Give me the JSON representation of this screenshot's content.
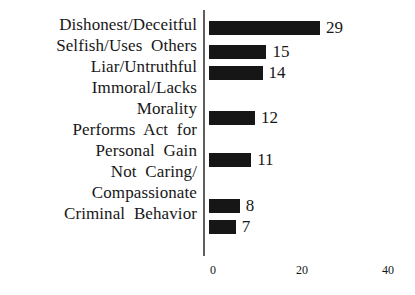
{
  "chart_data": {
    "type": "bar",
    "orientation": "horizontal",
    "title": "",
    "subtitle": "",
    "xlabel": "",
    "ylabel": "",
    "categories": [
      "Dishonest/Deceitful",
      "Selfish/Uses  Others",
      "Liar/Untruthful",
      "Immoral/Lacks\nMorality",
      "Performs  Act  for\nPersonal  Gain",
      "Not  Caring/\nCompassionate",
      "Criminal  Behavior"
    ],
    "values": [
      29,
      15,
      14,
      12,
      11,
      8,
      7
    ],
    "value_labels": [
      "29",
      "15",
      "14",
      "12",
      "11",
      "8",
      "7"
    ],
    "xlim": [
      0,
      40
    ],
    "xticks": [
      0,
      20,
      40
    ],
    "xtick_labels": [
      "0",
      "20",
      "40"
    ],
    "grid": false,
    "legend": null,
    "bar_color": "#161616",
    "axis_color": "#5f5f5f",
    "text_color": "#171717",
    "background_color": "#ffffff"
  },
  "labels": {
    "lines": [
      "Dishonest/Deceitful",
      "Selfish/Uses  Others",
      "Liar/Untruthful",
      "Immoral/Lacks",
      "Morality",
      "Performs  Act  for",
      "Personal  Gain",
      "Not  Caring/",
      "Compassionate",
      "Criminal  Behavior"
    ]
  },
  "bars": [
    {
      "name": "dishonest-deceitful",
      "value": 29,
      "label": "29",
      "top": 21
    },
    {
      "name": "selfish-uses-others",
      "value": 15,
      "label": "15",
      "top": 45
    },
    {
      "name": "liar-untruthful",
      "value": 14,
      "label": "14",
      "top": 66
    },
    {
      "name": "immoral-lacks-morality",
      "value": 12,
      "label": "12",
      "top": 111
    },
    {
      "name": "performs-act-for-personal-gain",
      "value": 11,
      "label": "11",
      "top": 153
    },
    {
      "name": "not-caring-compassionate",
      "value": 8,
      "label": "8",
      "top": 199
    },
    {
      "name": "criminal-behavior",
      "value": 7,
      "label": "7",
      "top": 220
    }
  ],
  "xticks": [
    {
      "label": "0",
      "x": 4
    },
    {
      "label": "20",
      "x": 93
    },
    {
      "label": "40",
      "x": 179
    }
  ],
  "scale": {
    "px_per_unit": 3.83
  }
}
